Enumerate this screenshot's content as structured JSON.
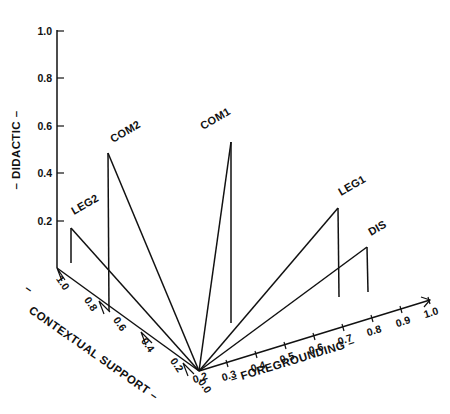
{
  "figure": {
    "kind": "3d-spike-plot",
    "background_color": "#ffffff",
    "line_color": "#111111"
  },
  "axes": {
    "vertical": {
      "title": "–  DIDACTIC  –",
      "name": "DIDACTIC",
      "ticks": [
        "0.2",
        "0.4",
        "0.6",
        "0.8",
        "1.0"
      ],
      "range": [
        0.0,
        1.0
      ]
    },
    "left": {
      "title": "CONTEXTUAL SUPPORT  –",
      "title_prefix": "–",
      "name": "CONTEXTUAL SUPPORT",
      "ticks": [
        "0.0",
        "0.2",
        "0.4",
        "0.6",
        "0.8",
        "1.0"
      ],
      "range": [
        0.0,
        1.0
      ]
    },
    "right": {
      "title": "–  FOREGROUNDING  –",
      "name": "FOREGROUNDING",
      "ticks": [
        "0.2",
        "0.3",
        "0.4",
        "0.5",
        "0.6",
        "0.7",
        "0.8",
        "0.9",
        "1.0"
      ],
      "range": [
        0.2,
        1.0
      ]
    }
  },
  "chart_data": {
    "type": "scatter",
    "title": "",
    "xlabel": "– FOREGROUNDING –",
    "ylabel": "CONTEXTUAL SUPPORT –",
    "zlabel": "– DIDACTIC –",
    "xlim": [
      0.2,
      1.0
    ],
    "ylim": [
      0.0,
      1.0
    ],
    "zlim": [
      0.0,
      1.0
    ],
    "grid": false,
    "legend": "none",
    "point_labels": [
      "LEG2",
      "COM2",
      "COM1",
      "LEG1",
      "DIS"
    ],
    "points": [
      {
        "label": "LEG2",
        "foregrounding": 0.2,
        "contextual_support": 0.93,
        "didactic": 0.16
      },
      {
        "label": "COM2",
        "foregrounding": 0.2,
        "contextual_support": 0.62,
        "didactic": 0.47
      },
      {
        "label": "COM1",
        "foregrounding": 0.3,
        "contextual_support": 0.0,
        "didactic": 0.55
      },
      {
        "label": "LEG1",
        "foregrounding": 0.7,
        "contextual_support": 0.0,
        "didactic": 0.24
      },
      {
        "label": "DIS",
        "foregrounding": 0.8,
        "contextual_support": 0.0,
        "didactic": 0.11
      }
    ]
  },
  "geometry": {
    "origin": {
      "x": 199,
      "y": 371
    },
    "vertical_axis_top": {
      "x": 57,
      "y": 30
    },
    "vertical_axis_base": {
      "x": 57,
      "y": 268
    },
    "left_axis_end": {
      "x": 57,
      "y": 268
    },
    "right_axis_end": {
      "x": 430,
      "y": 300
    },
    "ticks_vertical": [
      {
        "value": "1.0",
        "y": 31
      },
      {
        "value": "0.8",
        "y": 78
      },
      {
        "value": "0.6",
        "y": 126
      },
      {
        "value": "0.4",
        "y": 173
      },
      {
        "value": "0.2",
        "y": 221
      }
    ],
    "ticks_left": [
      {
        "value": "1.0",
        "x": 57,
        "y": 268
      },
      {
        "value": "0.8",
        "x": 85,
        "y": 289
      },
      {
        "value": "0.6",
        "x": 114,
        "y": 309
      },
      {
        "value": "0.4",
        "x": 142,
        "y": 330
      },
      {
        "value": "0.2",
        "x": 171,
        "y": 350
      },
      {
        "value": "0.0",
        "x": 199,
        "y": 371
      }
    ],
    "ticks_right": [
      {
        "value": "0.2",
        "x": 199,
        "y": 371
      },
      {
        "value": "0.3",
        "x": 228,
        "y": 369
      },
      {
        "value": "0.4",
        "x": 257,
        "y": 360
      },
      {
        "value": "0.5",
        "x": 286,
        "y": 351
      },
      {
        "value": "0.6",
        "x": 315,
        "y": 342
      },
      {
        "value": "0.7",
        "x": 344,
        "y": 333
      },
      {
        "value": "0.8",
        "x": 373,
        "y": 324
      },
      {
        "value": "0.9",
        "x": 402,
        "y": 315
      },
      {
        "value": "1.0",
        "x": 430,
        "y": 306
      }
    ],
    "spikes": [
      {
        "label": "LEG2",
        "base_x": 71,
        "base_y": 263,
        "top_x": 71,
        "top_y": 228,
        "label_x": 74,
        "label_y": 215
      },
      {
        "label": "COM2",
        "base_x": 109,
        "base_y": 311,
        "top_x": 108,
        "top_y": 153,
        "label_x": 113,
        "label_y": 143
      },
      {
        "label": "COM1",
        "base_x": 231,
        "base_y": 323,
        "top_x": 231,
        "top_y": 142,
        "label_x": 203,
        "label_y": 130
      },
      {
        "label": "LEG1",
        "base_x": 339,
        "base_y": 297,
        "top_x": 338,
        "top_y": 208,
        "label_x": 341,
        "label_y": 196
      },
      {
        "label": "DIS",
        "base_x": 368,
        "base_y": 292,
        "top_x": 367,
        "top_y": 247,
        "label_x": 371,
        "label_y": 236
      }
    ],
    "axis_titles": {
      "vertical": {
        "x": 20,
        "y": 150,
        "rotate": -90
      },
      "left": {
        "x": 30,
        "y": 318,
        "rotate": 35
      },
      "right": {
        "x": 228,
        "y": 372,
        "rotate": -17
      }
    }
  }
}
